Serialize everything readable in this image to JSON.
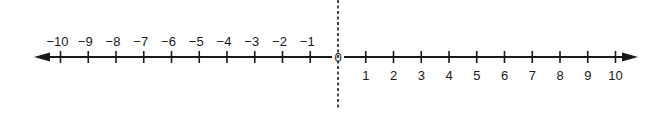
{
  "diagram": {
    "type": "number-line",
    "range": [
      -10,
      10
    ],
    "step": 1,
    "origin_label": "0",
    "negative_labels": [
      "−10",
      "−9",
      "−8",
      "−7",
      "−6",
      "−5",
      "−4",
      "−3",
      "−2",
      "−1"
    ],
    "positive_labels": [
      "1",
      "2",
      "3",
      "4",
      "5",
      "6",
      "7",
      "8",
      "9",
      "10"
    ],
    "arrows": [
      "left",
      "right"
    ],
    "vertical_dashed_line_at": 0,
    "colors": {
      "line": "#1a1a1a",
      "background": "#ffffff"
    }
  }
}
